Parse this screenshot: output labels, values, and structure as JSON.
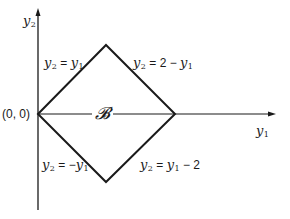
{
  "figure": {
    "axes": {
      "y_axis_label": "y",
      "y_axis_sub": "2",
      "x_axis_label": "y",
      "x_axis_sub": "1",
      "origin_label": "(0, 0)"
    },
    "region_label": "𝓑",
    "edges": {
      "top_left": {
        "lhs": "y",
        "lhs_sub": "2",
        "eq": " = ",
        "rhs": "y",
        "rhs_sub": "1",
        "rhs_prefix": ""
      },
      "top_right": {
        "lhs": "y",
        "lhs_sub": "2",
        "eq": " = ",
        "rhs_prefix": "2 − ",
        "rhs": "y",
        "rhs_sub": "1"
      },
      "bottom_left": {
        "lhs": "y",
        "lhs_sub": "2",
        "eq": " = ",
        "rhs_prefix": "−",
        "rhs": "y",
        "rhs_sub": "1"
      },
      "bottom_right": {
        "lhs": "y",
        "lhs_sub": "2",
        "eq": " = ",
        "rhs": "y",
        "rhs_sub": "1",
        "rhs_suffix": " − 2"
      }
    },
    "vertices": [
      "(0,0)",
      "(1,1)",
      "(2,0)",
      "(1,-1)"
    ],
    "colors": {
      "ink": "#1a1a1a",
      "background": "#ffffff"
    }
  }
}
